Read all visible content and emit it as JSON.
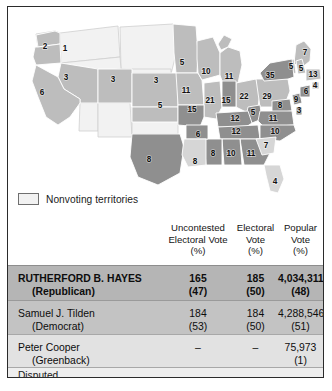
{
  "legend": {
    "swatch_name": "nonvoting-territories-swatch",
    "label": "Nonvoting territories"
  },
  "table": {
    "headers": {
      "candidate": "",
      "uncontested": [
        "Uncontested",
        "Electoral Vote",
        "(%)"
      ],
      "electoral": [
        "Electoral",
        "Vote",
        "(%)"
      ],
      "popular": [
        "Popular",
        "Vote",
        "(%)"
      ]
    },
    "rows": [
      {
        "name": "RUTHERFORD B. HAYES",
        "party": "(Republican)",
        "uncontested": "165",
        "uncontested_pct": "(47)",
        "electoral": "185",
        "electoral_pct": "(50)",
        "popular": "4,034,311",
        "popular_pct": "(48)"
      },
      {
        "name": "Samuel J. Tilden",
        "party": "(Democrat)",
        "uncontested": "184",
        "uncontested_pct": "(53)",
        "electoral": "184",
        "electoral_pct": "(50)",
        "popular": "4,288,546",
        "popular_pct": "(51)"
      },
      {
        "name": "Peter Cooper",
        "party": "(Greenback)",
        "uncontested": "–",
        "uncontested_pct": "",
        "electoral": "–",
        "electoral_pct": "",
        "popular": "75,973",
        "popular_pct": "(1)"
      }
    ],
    "footer": "Disputed"
  },
  "colors": {
    "hayes_row": "#b5b5b5",
    "tilden_row": "#c3c3c3",
    "cooper_row": "#e2e2e2",
    "disputed_row": "#eeeeee",
    "republican_state": "#bdbdbd",
    "democrat_state": "#8f8f8f",
    "disputed_state": "#d6d6d6",
    "territory": "#f2f2f2",
    "frame": "#2b2b2b"
  },
  "map": {
    "title": "",
    "states": [
      {
        "name": "Oregon",
        "abbr": "OR",
        "votes": "2",
        "x": 37,
        "y": 40,
        "party": "republican"
      },
      {
        "name": "Idaho Terr.",
        "abbr": "ID",
        "votes": "1",
        "x": 57,
        "y": 42,
        "party": "republican"
      },
      {
        "name": "Nevada",
        "abbr": "NV",
        "votes": "3",
        "x": 58,
        "y": 71,
        "party": "republican"
      },
      {
        "name": "California",
        "abbr": "CA",
        "votes": "6",
        "x": 34,
        "y": 86,
        "party": "republican"
      },
      {
        "name": "Colorado",
        "abbr": "CO",
        "votes": "3",
        "x": 105,
        "y": 73,
        "party": "republican"
      },
      {
        "name": "Nebraska",
        "abbr": "NE",
        "votes": "3",
        "x": 148,
        "y": 74,
        "party": "republican"
      },
      {
        "name": "Kansas",
        "abbr": "KS",
        "votes": "5",
        "x": 152,
        "y": 99,
        "party": "republican"
      },
      {
        "name": "Minnesota",
        "abbr": "MN",
        "votes": "5",
        "x": 174,
        "y": 56,
        "party": "republican"
      },
      {
        "name": "Iowa",
        "abbr": "IA",
        "votes": "11",
        "x": 178,
        "y": 84,
        "party": "republican"
      },
      {
        "name": "Wisconsin",
        "abbr": "WI",
        "votes": "10",
        "x": 198,
        "y": 65,
        "party": "republican"
      },
      {
        "name": "Michigan",
        "abbr": "MI",
        "votes": "11",
        "x": 221,
        "y": 70,
        "party": "republican"
      },
      {
        "name": "Missouri",
        "abbr": "MO",
        "votes": "15",
        "x": 184,
        "y": 103,
        "party": "democrat"
      },
      {
        "name": "Illinois",
        "abbr": "IL",
        "votes": "21",
        "x": 202,
        "y": 94,
        "party": "republican"
      },
      {
        "name": "Indiana",
        "abbr": "IN",
        "votes": "15",
        "x": 218,
        "y": 94,
        "party": "democrat"
      },
      {
        "name": "Ohio",
        "abbr": "OH",
        "votes": "22",
        "x": 236,
        "y": 90,
        "party": "republican"
      },
      {
        "name": "Pennsylvania",
        "abbr": "PA",
        "votes": "29",
        "x": 259,
        "y": 90,
        "party": "republican"
      },
      {
        "name": "New York",
        "abbr": "NY",
        "votes": "35",
        "x": 262,
        "y": 69,
        "party": "democrat"
      },
      {
        "name": "Maine",
        "abbr": "ME",
        "votes": "7",
        "x": 297,
        "y": 46,
        "party": "republican"
      },
      {
        "name": "Vermont",
        "abbr": "VT",
        "votes": "5",
        "x": 283,
        "y": 60,
        "party": "republican"
      },
      {
        "name": "New Hampshire",
        "abbr": "NH",
        "votes": "5",
        "x": 293,
        "y": 62,
        "party": "republican"
      },
      {
        "name": "Massachusetts",
        "abbr": "MA",
        "votes": "13",
        "x": 305,
        "y": 68,
        "party": "republican"
      },
      {
        "name": "Rhode Island",
        "abbr": "RI",
        "votes": "4",
        "x": 307,
        "y": 79,
        "party": "republican"
      },
      {
        "name": "Connecticut",
        "abbr": "CT",
        "votes": "6",
        "x": 298,
        "y": 85,
        "party": "democrat"
      },
      {
        "name": "New Jersey",
        "abbr": "NJ",
        "votes": "9",
        "x": 288,
        "y": 93,
        "party": "democrat"
      },
      {
        "name": "Delaware",
        "abbr": "DE",
        "votes": "3",
        "x": 291,
        "y": 104,
        "party": "democrat"
      },
      {
        "name": "Maryland",
        "abbr": "MD",
        "votes": "8",
        "x": 272,
        "y": 99,
        "party": "democrat"
      },
      {
        "name": "West Virginia",
        "abbr": "WV",
        "votes": "5",
        "x": 245,
        "y": 106,
        "party": "democrat"
      },
      {
        "name": "Virginia",
        "abbr": "VA",
        "votes": "11",
        "x": 265,
        "y": 112,
        "party": "democrat"
      },
      {
        "name": "Kentucky",
        "abbr": "KY",
        "votes": "12",
        "x": 227,
        "y": 112,
        "party": "democrat"
      },
      {
        "name": "Tennessee",
        "abbr": "TN",
        "votes": "12",
        "x": 228,
        "y": 125,
        "party": "democrat"
      },
      {
        "name": "North Carolina",
        "abbr": "NC",
        "votes": "10",
        "x": 267,
        "y": 125,
        "party": "democrat"
      },
      {
        "name": "South Carolina",
        "abbr": "SC",
        "votes": "7",
        "x": 258,
        "y": 139,
        "party": "disputed"
      },
      {
        "name": "Georgia",
        "abbr": "GA",
        "votes": "11",
        "x": 243,
        "y": 147,
        "party": "democrat"
      },
      {
        "name": "Alabama",
        "abbr": "AL",
        "votes": "10",
        "x": 223,
        "y": 147,
        "party": "democrat"
      },
      {
        "name": "Mississippi",
        "abbr": "MS",
        "votes": "8",
        "x": 205,
        "y": 147,
        "party": "democrat"
      },
      {
        "name": "Arkansas",
        "abbr": "AR",
        "votes": "6",
        "x": 190,
        "y": 128,
        "party": "democrat"
      },
      {
        "name": "Louisiana",
        "abbr": "LA",
        "votes": "8",
        "x": 187,
        "y": 155,
        "party": "disputed"
      },
      {
        "name": "Texas",
        "abbr": "TX",
        "votes": "8",
        "x": 141,
        "y": 153,
        "party": "democrat"
      },
      {
        "name": "Florida",
        "abbr": "FL",
        "votes": "4",
        "x": 267,
        "y": 175,
        "party": "disputed"
      }
    ]
  }
}
